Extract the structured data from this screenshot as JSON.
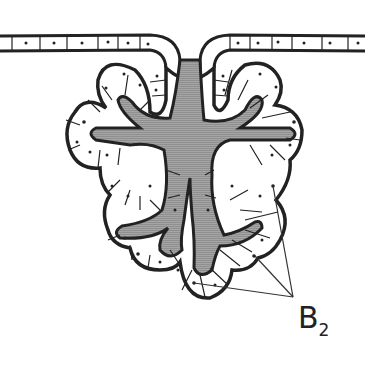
{
  "diagram": {
    "colors": {
      "outline": "#222222",
      "lumen": "#9a9a9a",
      "cells": "#ffffff",
      "background": "#ffffff"
    },
    "label": {
      "text": "B",
      "subscript": "2",
      "pointer_targets": 3
    }
  }
}
